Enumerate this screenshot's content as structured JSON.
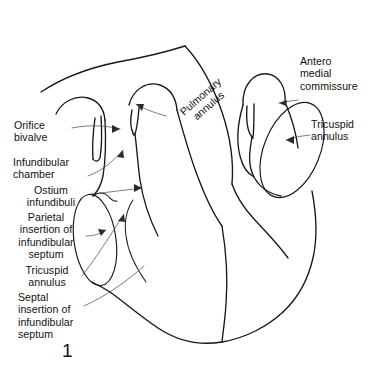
{
  "figure": {
    "number": "1",
    "background_color": "#ffffff",
    "line_color": "#181818",
    "leader_color": "#4a4a4a",
    "text_color": "#111111",
    "width": 376,
    "height": 371
  },
  "labels": {
    "orifice_bivalve": "Orifice\nbivalve",
    "infundibular_chamber": "Infundibular\nchamber",
    "ostium_infundibuli": "Ostium\ninfundibuli",
    "parietal_insertion": "Parietal\ninsertion of\ninfundibular\nseptum",
    "tricuspid_annulus_left": "Tricuspid\nannulus",
    "septal_insertion": "Septal\ninsertion of\ninfundibular\nseptum",
    "pulmonary_annulus": "Pulmonary\nannulus",
    "antero_medial_commissure": "Antero\nmedial\ncommissure",
    "tricuspid_annulus_right": "Tricuspid\nannulus"
  }
}
